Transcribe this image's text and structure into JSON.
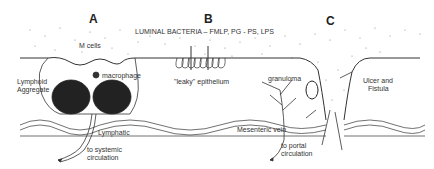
{
  "diagram": {
    "panels": [
      {
        "id": "A",
        "label": "A"
      },
      {
        "id": "B",
        "label": "B"
      },
      {
        "id": "C",
        "label": "C"
      }
    ],
    "header_label": "LUMINAL  BACTERIA  –  FMLP, PG - PS, LPS",
    "labels": {
      "m_cells": "M cells",
      "macrophage": "macrophage",
      "lymphoid_1": "Lymphoid",
      "lymphoid_2": "Aggregate",
      "lymphatic": "Lymphatic",
      "systemic_1": "to systemic",
      "systemic_2": "circulation",
      "leaky": "\"leaky\" epithelium",
      "granuloma": "granuloma",
      "ulcer_1": "Ulcer and",
      "ulcer_2": "Fistula",
      "mesenteric": "Mesenteric vein",
      "portal_1": "to portal",
      "portal_2": "circulation"
    },
    "colors": {
      "line": "#333333",
      "dots": "#777777",
      "background": "#ffffff"
    }
  }
}
